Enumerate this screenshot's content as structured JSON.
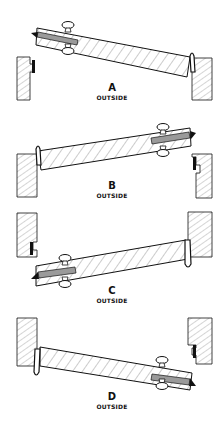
{
  "diagram": {
    "type": "door-swing-illustration",
    "panels": [
      {
        "id": "A",
        "letter": "A",
        "caption": "OUTSIDE",
        "knob_side": "left",
        "hinge_side": "right",
        "letter_y": 83,
        "caption_y": 95
      },
      {
        "id": "B",
        "letter": "B",
        "caption": "OUTSIDE",
        "knob_side": "right",
        "hinge_side": "left",
        "letter_y": 181,
        "caption_y": 193
      },
      {
        "id": "C",
        "letter": "C",
        "caption": "OUTSIDE",
        "knob_side": "left",
        "hinge_side": "right",
        "letter_y": 286,
        "caption_y": 298
      },
      {
        "id": "D",
        "letter": "D",
        "caption": "OUTSIDE",
        "knob_side": "right",
        "hinge_side": "left",
        "letter_y": 392,
        "caption_y": 404
      }
    ],
    "colors": {
      "ink": "#111111",
      "bolt": "#9a9a9a",
      "background": "#ffffff"
    }
  }
}
